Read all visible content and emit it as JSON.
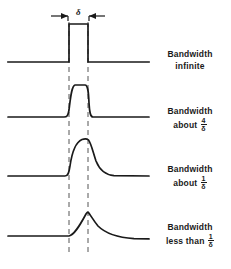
{
  "figure": {
    "ink_color": "#1a1a1a",
    "background": "#ffffff",
    "width": 231,
    "height": 269
  },
  "annotation": {
    "pulse_width_symbol": "δ",
    "arrow_left_name": "left-dimension-arrow",
    "arrow_right_name": "right-dimension-arrow",
    "dashed_line_left_x": 69,
    "dashed_line_right_x": 88
  },
  "traces": [
    {
      "id": "trace-1",
      "baseline_y": 62,
      "peak_y": 24,
      "shape": "ideal-rectangular-pulse",
      "label": {
        "line1": "Bandwidth",
        "line2_prefix": "infinite",
        "fraction": null
      }
    },
    {
      "id": "trace-2",
      "baseline_y": 117,
      "peak_y": 84,
      "shape": "rounded-flat-top-pulse",
      "label": {
        "line1": "Bandwidth",
        "line2_prefix": "about",
        "fraction": {
          "numerator": "4",
          "denominator": "δ"
        }
      }
    },
    {
      "id": "trace-3",
      "baseline_y": 176,
      "peak_y": 139,
      "shape": "rounded-hump-with-decay",
      "label": {
        "line1": "Bandwidth",
        "line2_prefix": "about",
        "fraction": {
          "numerator": "1",
          "denominator": "δ"
        }
      }
    },
    {
      "id": "trace-4",
      "baseline_y": 236,
      "peak_y": 212,
      "shape": "low-peak-slow-decay",
      "label": {
        "line1": "Bandwidth",
        "line2_prefix": "less than",
        "fraction": {
          "numerator": "1",
          "denominator": "δ"
        }
      }
    }
  ]
}
